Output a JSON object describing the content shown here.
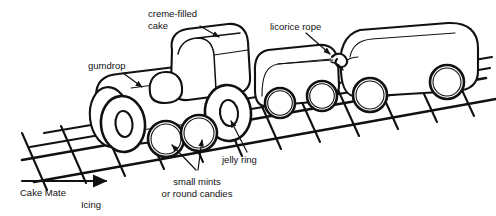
{
  "figure": {
    "line_color": "#111111",
    "background": "#ffffff"
  },
  "labels": {
    "creme_filled_cake": {
      "line1": "creme-filled",
      "line2": "cake"
    },
    "gumdrop": {
      "line1": "gumdrop"
    },
    "licorice_rope": {
      "line1": "licorice rope"
    },
    "jelly_ring": {
      "line1": "jelly ring"
    },
    "small_mints": {
      "line1": "small mints",
      "line2": "or round candies"
    },
    "cake_mate_icing": {
      "line1": "Cake Mate",
      "line2": "Icing"
    }
  },
  "parts": [
    {
      "name": "locomotive-body",
      "kind": "cylinder"
    },
    {
      "name": "creme-filled-cake-cab",
      "kind": "rounded-box"
    },
    {
      "name": "gumdrop-dome",
      "kind": "dome"
    },
    {
      "name": "jelly-ring-wheel-front",
      "kind": "ring"
    },
    {
      "name": "jelly-ring-wheel-rear",
      "kind": "ring"
    },
    {
      "name": "mint-wheel-left",
      "kind": "disc"
    },
    {
      "name": "mint-wheel-right",
      "kind": "disc"
    },
    {
      "name": "middle-car-body",
      "kind": "rounded-box"
    },
    {
      "name": "middle-car-wheel-front",
      "kind": "disc"
    },
    {
      "name": "middle-car-wheel-rear",
      "kind": "disc"
    },
    {
      "name": "rear-car-body",
      "kind": "rounded-box"
    },
    {
      "name": "rear-car-wheel-front",
      "kind": "disc"
    },
    {
      "name": "rear-car-wheel-rear",
      "kind": "disc"
    },
    {
      "name": "licorice-rope-coupler-front",
      "kind": "loop"
    },
    {
      "name": "licorice-rope-coupler-rear",
      "kind": "loop"
    },
    {
      "name": "icing-track",
      "kind": "rail-grid"
    }
  ]
}
